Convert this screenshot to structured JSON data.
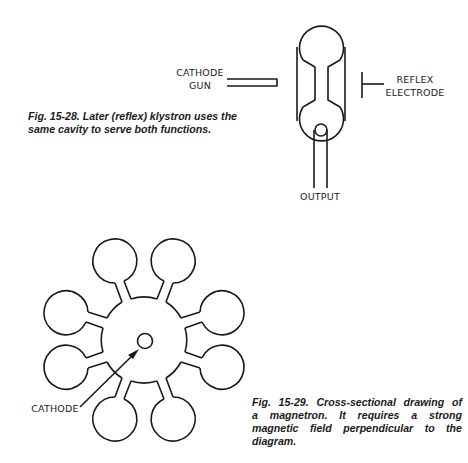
{
  "figures": [
    {
      "id": "fig-15-28",
      "subject": "reflex klystron",
      "caption_lines": [
        "Fig. 15-28. Later (reflex) klystron uses the",
        "same cavity to serve both functions."
      ],
      "labels": {
        "cathode_gun": [
          "CATHODE",
          "GUN"
        ],
        "reflex_electrode": [
          "REFLEX",
          "ELECTRODE"
        ],
        "output": "OUTPUT"
      }
    },
    {
      "id": "fig-15-29",
      "subject": "magnetron cross-section",
      "caption_lines": [
        "Fig. 15-29. Cross-sectional drawing of",
        "a magnetron. It requires a strong",
        "magnetic field perpendicular to the",
        "diagram."
      ],
      "labels": {
        "cathode": "CATHODE"
      },
      "resonator_cavity_count": 8
    }
  ],
  "colors": {
    "ink": "#1a1a1a",
    "paper": "#ffffff"
  }
}
